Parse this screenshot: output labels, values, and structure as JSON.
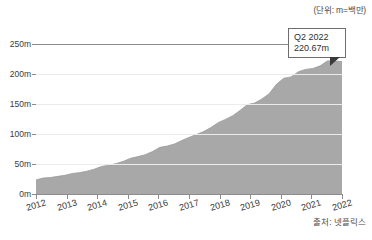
{
  "unit_note": "(단위: m=백만)",
  "source_note": "출처: 넷플릭스",
  "callout": {
    "line1": "Q2 2022",
    "line2": "220.67m"
  },
  "colors": {
    "area_fill": "#a8a8a8",
    "area_stroke": "#9a9a9a",
    "grid": "#ebebeb",
    "axis": "#8c8c8c",
    "text": "#3b3b3b",
    "callout_border": "#6e6e6e",
    "callout_pointer": "#3a3a3a",
    "background": "#ffffff"
  },
  "chart_data": {
    "type": "area",
    "title": "",
    "subtitle": "",
    "xlabel": "",
    "ylabel": "",
    "unit": "m = 백만 (millions)",
    "source": "출처: 넷플릭스",
    "grid": true,
    "legend": "none",
    "xlim": [
      "2011 Q4",
      "2022 Q2"
    ],
    "ylim": [
      0,
      250
    ],
    "yticks": [
      0,
      50,
      100,
      150,
      200,
      250
    ],
    "ytick_labels": [
      "0m",
      "50m",
      "100m",
      "150m",
      "200m",
      "250m"
    ],
    "xticks": [
      "2012",
      "2013",
      "2014",
      "2015",
      "2016",
      "2017",
      "2018",
      "2019",
      "2020",
      "2021",
      "2022"
    ],
    "annotations": [
      {
        "label": "Q2 2022",
        "value": 220.67,
        "value_label": "220.67m"
      }
    ],
    "series": [
      {
        "name": "넷플릭스 유료 구독자 수",
        "x": [
          "2011 Q4",
          "2012 Q1",
          "2012 Q2",
          "2012 Q3",
          "2012 Q4",
          "2013 Q1",
          "2013 Q2",
          "2013 Q3",
          "2013 Q4",
          "2014 Q1",
          "2014 Q2",
          "2014 Q3",
          "2014 Q4",
          "2015 Q1",
          "2015 Q2",
          "2015 Q3",
          "2015 Q4",
          "2016 Q1",
          "2016 Q2",
          "2016 Q3",
          "2016 Q4",
          "2017 Q1",
          "2017 Q2",
          "2017 Q3",
          "2017 Q4",
          "2018 Q1",
          "2018 Q2",
          "2018 Q3",
          "2018 Q4",
          "2019 Q1",
          "2019 Q2",
          "2019 Q3",
          "2019 Q4",
          "2020 Q1",
          "2020 Q2",
          "2020 Q3",
          "2020 Q4",
          "2021 Q1",
          "2021 Q2",
          "2021 Q3",
          "2021 Q4",
          "2022 Q1",
          "2022 Q2"
        ],
        "values": [
          23.53,
          26.63,
          27.56,
          29.39,
          31.25,
          34.24,
          35.63,
          38.01,
          41.43,
          45.91,
          47.99,
          50.65,
          54.48,
          59.62,
          62.31,
          65.55,
          70.84,
          77.71,
          79.9,
          83.28,
          89.09,
          94.36,
          99.04,
          104.02,
          110.64,
          118.9,
          124.35,
          130.42,
          139.26,
          148.86,
          151.56,
          158.33,
          167.09,
          182.86,
          192.95,
          195.15,
          203.66,
          207.64,
          209.18,
          213.56,
          221.84,
          221.64,
          220.67
        ]
      }
    ]
  }
}
